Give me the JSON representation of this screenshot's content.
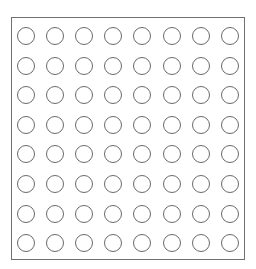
{
  "grid": {
    "rows": 8,
    "cols": 8,
    "shape": "circle",
    "fill": "#ffffff",
    "stroke": "#6a6a6a",
    "frame_stroke": "#707070"
  }
}
